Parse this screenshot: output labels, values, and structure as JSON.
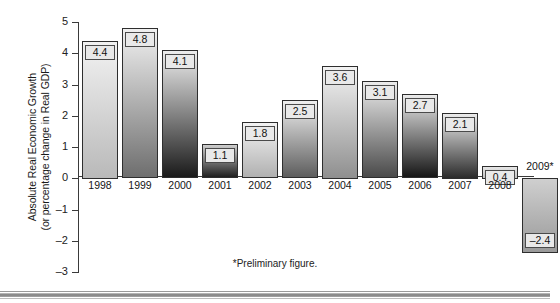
{
  "chart_data": {
    "type": "bar",
    "title": "",
    "xlabel": "",
    "ylabel": "Absolute Real Economic Growth (or percentage change in Real GDP)",
    "ylabel_line1": "Absolute Real Economic Growth",
    "ylabel_line2": "(or percentage change in Real GDP)",
    "ylim": [
      -3,
      5
    ],
    "yticks": [
      5,
      4,
      3,
      2,
      1,
      0,
      -1,
      -2,
      -3
    ],
    "ytick_labels": [
      "5",
      "4",
      "3",
      "2",
      "1",
      "0",
      "–1",
      "–2",
      "–3"
    ],
    "grid": false,
    "legend": false,
    "categories": [
      "1998",
      "1999",
      "2000",
      "2001",
      "2002",
      "2003",
      "2004",
      "2005",
      "2006",
      "2007",
      "2008",
      "2009*"
    ],
    "values": [
      4.4,
      4.8,
      4.1,
      1.1,
      1.8,
      2.5,
      3.6,
      3.1,
      2.7,
      2.1,
      0.4,
      -2.4
    ],
    "value_labels": [
      "4.4",
      "4.8",
      "4.1",
      "1.1",
      "1.8",
      "2.5",
      "3.6",
      "3.1",
      "2.7",
      "2.1",
      "0.4",
      "–2.4"
    ],
    "bar_shades": [
      {
        "top": "#f2f2f2",
        "bottom": "#b9b9b9"
      },
      {
        "top": "#f0f0f0",
        "bottom": "#6e6e6e"
      },
      {
        "top": "#ededed",
        "bottom": "#1a1a1a"
      },
      {
        "top": "#cfcfcf",
        "bottom": "#1f1f1f"
      },
      {
        "top": "#f3f3f3",
        "bottom": "#b0b0b0"
      },
      {
        "top": "#efefef",
        "bottom": "#5d5d5d"
      },
      {
        "top": "#f3f3f3",
        "bottom": "#8f8f8f"
      },
      {
        "top": "#ececec",
        "bottom": "#4a4a4a"
      },
      {
        "top": "#ebebeb",
        "bottom": "#161616"
      },
      {
        "top": "#ececec",
        "bottom": "#2b2b2b"
      },
      {
        "top": "#e6e6e6",
        "bottom": "#c2c2c2"
      },
      {
        "top": "#cfcfcf",
        "bottom": "#9a9a9a"
      }
    ],
    "annotation": "*Preliminary figure.",
    "axis_color": "#3a3a3a"
  },
  "footnote": "*Preliminary figure."
}
